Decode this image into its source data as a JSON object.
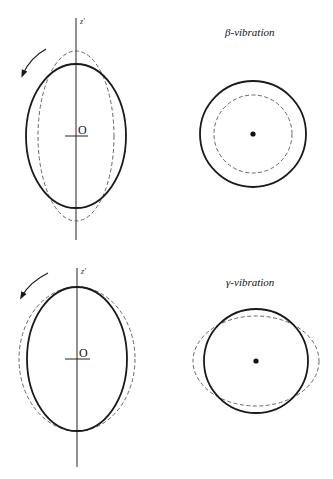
{
  "figure": {
    "panels": [
      {
        "id": "beta",
        "title": "β-vibration",
        "side_view": {
          "axis_label": "z'",
          "origin_label": "O",
          "rotation_arrow": "counterclockwise",
          "solid_ellipse": {
            "cx": 76,
            "cy": 136,
            "rx": 50,
            "ry": 72
          },
          "dashed_ellipse": {
            "cx": 76,
            "cy": 136,
            "rx": 38,
            "ry": 85
          }
        },
        "top_view": {
          "solid_circle": {
            "cx": 253,
            "cy": 134,
            "r": 53
          },
          "dashed_circle": {
            "cx": 253,
            "cy": 134,
            "r": 39
          }
        }
      },
      {
        "id": "gamma",
        "title": "γ-vibration",
        "side_view": {
          "axis_label": "z'",
          "origin_label": "O",
          "rotation_arrow": "counterclockwise",
          "solid_ellipse": {
            "cx": 77,
            "cy": 359,
            "rx": 50,
            "ry": 72
          },
          "dashed_ellipse": {
            "cx": 77,
            "cy": 359,
            "rx": 58,
            "ry": 72
          }
        },
        "top_view": {
          "solid_circle": {
            "cx": 256,
            "cy": 361,
            "r": 52
          },
          "dashed_ellipse": {
            "cx": 256,
            "cy": 361,
            "rx": 63,
            "ry": 45
          }
        }
      }
    ],
    "colors": {
      "solid_stroke": "#1a1a1a",
      "dashed_stroke": "#555555",
      "axis_stroke": "#222222"
    }
  }
}
